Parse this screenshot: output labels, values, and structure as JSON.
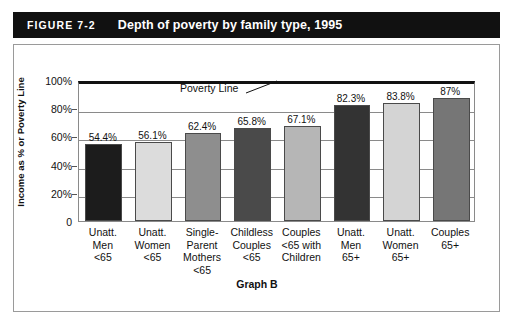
{
  "header": {
    "figure_number": "FIGURE 7-2",
    "figure_title": "Depth of poverty by family type, 1995",
    "bar_color": "#111111",
    "text_color": "#ffffff"
  },
  "caption": "Graph B",
  "annotation": {
    "poverty_line_label": "Poverty Line"
  },
  "chart_data": {
    "type": "bar",
    "title": "Depth of poverty by family type, 1995",
    "subtitle": "Graph B",
    "xlabel": "",
    "ylabel": "Income as % or Poverty Line",
    "ylim": [
      0,
      100
    ],
    "yticks": [
      0,
      20,
      40,
      60,
      80,
      100
    ],
    "ytick_labels": [
      "0",
      "20%",
      "40%",
      "60%",
      "80%",
      "100%"
    ],
    "grid": true,
    "legend": "none",
    "annotations": [
      {
        "text": "Poverty Line",
        "y": 100,
        "note": "leader line points to the 100% axis line"
      }
    ],
    "categories": [
      "Unatt.\nMen\n<65",
      "Unatt.\nWomen\n<65",
      "Single-\nParent\nMothers\n<65",
      "Childless\nCouples\n<65",
      "Couples\n<65 with\nChildren",
      "Unatt.\nMen\n65+",
      "Unatt.\nWomen\n65+",
      "Couples\n65+"
    ],
    "values": [
      54.4,
      56.1,
      62.4,
      65.8,
      67.1,
      82.3,
      83.8,
      87
    ],
    "value_labels": [
      "54.4%",
      "56.1%",
      "62.4%",
      "65.8%",
      "67.1%",
      "82.3%",
      "83.8%",
      "87%"
    ],
    "bar_colors": [
      "#1c1c1c",
      "#dcdcdc",
      "#8e8e8e",
      "#4a4a4a",
      "#b6b6b6",
      "#333333",
      "#d4d4d4",
      "#767676"
    ]
  }
}
